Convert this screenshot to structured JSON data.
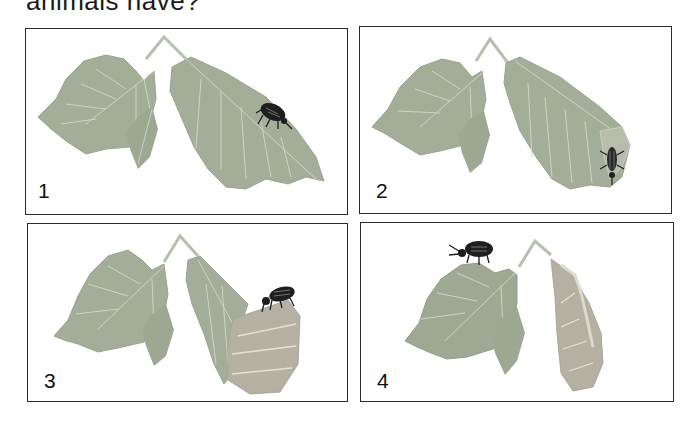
{
  "heading": {
    "text": "animals have?"
  },
  "colors": {
    "leaf": "#a4ad97",
    "leaf_dark": "#8f9984",
    "vein": "#cfd5c6",
    "stem": "#b7bfae",
    "rolled_leaf": "#b4b0a2",
    "beetle": "#1e1e1e",
    "border": "#2a2a2a"
  },
  "panels": [
    {
      "label": "1",
      "description": "Beetle walking on leaf"
    },
    {
      "label": "2",
      "description": "Beetle begins rolling the leaf tip"
    },
    {
      "label": "3",
      "description": "Beetle on top of partially rolled leaf"
    },
    {
      "label": "4",
      "description": "Leaf fully rolled; beetle leaves on other leaf"
    }
  ]
}
